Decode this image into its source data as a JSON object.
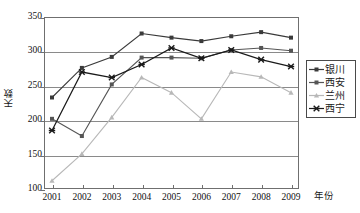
{
  "chart_data": {
    "type": "line",
    "title": "",
    "xlabel": "年份",
    "ylabel": "天数",
    "categories": [
      "2001",
      "2002",
      "2003",
      "2004",
      "2005",
      "2006",
      "2007",
      "2008",
      "2009"
    ],
    "ylim": [
      100,
      350
    ],
    "yticks": [
      100,
      150,
      200,
      250,
      300,
      350
    ],
    "grid": true,
    "legend_position": "right",
    "series": [
      {
        "name": "银川",
        "color": "#3a3a3a",
        "marker": "square",
        "values": [
          233,
          276,
          292,
          326,
          320,
          315,
          322,
          328,
          320
        ]
      },
      {
        "name": "西安",
        "color": "#555555",
        "marker": "square",
        "values": [
          202,
          177,
          252,
          291,
          291,
          290,
          302,
          305,
          301
        ]
      },
      {
        "name": "兰州",
        "color": "#b8b8b8",
        "marker": "triangle",
        "values": [
          112,
          151,
          204,
          262,
          240,
          202,
          270,
          263,
          240
        ]
      },
      {
        "name": "西宁",
        "color": "#1a1a1a",
        "marker": "cross",
        "values": [
          185,
          270,
          262,
          281,
          305,
          290,
          302,
          288,
          278
        ]
      }
    ]
  },
  "axis": {
    "y_tick_labels": [
      "350",
      "300",
      "250",
      "200",
      "150",
      "100"
    ],
    "x_tick_labels": [
      "2001",
      "2002",
      "2003",
      "2004",
      "2005",
      "2006",
      "2007",
      "2008",
      "2009"
    ],
    "y_axis_title": "天数",
    "x_axis_title": "年份"
  },
  "legend": {
    "items": [
      {
        "label": "银川"
      },
      {
        "label": "西安"
      },
      {
        "label": "兰州"
      },
      {
        "label": "西宁"
      }
    ]
  }
}
